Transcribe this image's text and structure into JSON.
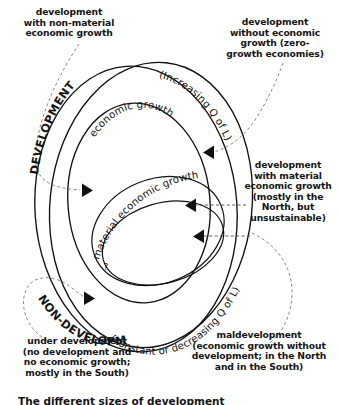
{
  "figure": {
    "title_caption": "The different sizes of development",
    "background_color": "#ffffff",
    "line_color": "#111111",
    "dash_color": "#7d7d7d",
    "text_color": "#141414"
  },
  "annotations": {
    "top_left": "development\nwith non-material\neconomic growth",
    "top_right": "development\nwithout economic\ngrowth (zero-\ngrowth economies)",
    "middle_right": "development\nwith material\neconomic growth\n(mostly in the\nNorth, but\nunsustainable)",
    "bottom_left": "under development\n(no development and\nno economic growth;\nmostly in the South)",
    "bottom_right": "maldevelopment\n(economic growth without\ndevelopment; in the North\nand in the South)"
  },
  "curved_labels": {
    "development_head": "DEVELOPMENT",
    "development_tail": "(Increasing Q of L)",
    "nondevelopment_head": "NON-DEVELOPMENT",
    "nondevelopment_tail": "(constant or decreasing Q of L)",
    "economic_growth": "economic growth",
    "material_economic_growth": "material economic growth",
    "question_mark": "?"
  },
  "regions": [
    {
      "name": "development-outer-oval",
      "label": "DEVELOPMENT (Increasing Q of L)"
    },
    {
      "name": "economic-growth-oval",
      "label": "economic growth"
    },
    {
      "name": "material-economic-growth-oval",
      "label": "material economic growth"
    },
    {
      "name": "nondevelopment-outer-oval",
      "label": "NON-DEVELOPMENT (constant or decreasing Q of L)"
    }
  ],
  "connectors": [
    {
      "name": "non-material-growth-connector",
      "from": "top_left",
      "arrow": "right",
      "arrow_x": 88,
      "arrow_y": 190
    },
    {
      "name": "zero-growth-connector",
      "from": "top_right",
      "arrow": "left",
      "arrow_x": 212,
      "arrow_y": 152
    },
    {
      "name": "material-growth-connector-upper",
      "from": "middle_right",
      "arrow": "left",
      "arrow_x": 192,
      "arrow_y": 205
    },
    {
      "name": "material-growth-connector-lower",
      "from": "middle_right",
      "arrow": "left",
      "arrow_x": 200,
      "arrow_y": 235
    },
    {
      "name": "under-development-connector",
      "from": "bottom_left",
      "arrow": "right",
      "arrow_x": 92,
      "arrow_y": 298
    },
    {
      "name": "maldevelopment-connector",
      "from": "bottom_right",
      "arrow": "none",
      "arrow_x": 0,
      "arrow_y": 0
    }
  ]
}
